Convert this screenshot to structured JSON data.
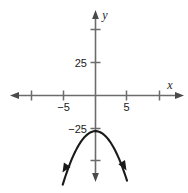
{
  "figure": {
    "width": 188,
    "height": 193,
    "background_color": "#ffffff",
    "axis_color": "#6b6b6b",
    "curve_color": "#1a1a1a",
    "text_color": "#1a1a1a"
  },
  "axes": {
    "x_axis_label": "x",
    "y_axis_label": "y",
    "x_tick_labels": [
      "-5",
      "5"
    ],
    "y_tick_labels": [
      "25",
      "-25"
    ],
    "x_tick_label_minus5": "−5",
    "x_tick_label_5": "5",
    "y_tick_label_25": "25",
    "y_tick_label_minus25": "−25"
  },
  "chart_data": {
    "type": "line",
    "title": "",
    "subtitle": "",
    "xlabel": "x",
    "ylabel": "y",
    "grid": false,
    "legend": null,
    "xlim": [
      -13.3,
      14.0
    ],
    "ylim": [
      -65.4,
      65.4
    ],
    "xticks": [
      -10,
      -5,
      5,
      10
    ],
    "xticklabels": [
      "",
      "-5",
      "5",
      ""
    ],
    "yticks": [
      50,
      25,
      -25,
      -50
    ],
    "yticklabels": [
      "",
      "25",
      "-25",
      ""
    ],
    "x_axis_arrows": [
      "left",
      "right"
    ],
    "y_axis_arrows": [
      "up",
      "down"
    ],
    "series": [
      {
        "name": "parabola",
        "shape": "downward-opening parabola",
        "vertex": [
          0,
          -27
        ],
        "leading_coefficient": -1.5,
        "equation": "y = -1.5x^2 - 27",
        "arrow_ends": [
          "left",
          "right"
        ],
        "x": [
          -5.2,
          -4.5,
          -4.0,
          -3.0,
          -2.0,
          -1.0,
          0.0,
          1.0,
          2.0,
          3.0,
          4.0,
          4.5,
          5.0
        ],
        "y": [
          -67.6,
          -57.4,
          -51.0,
          -40.5,
          -33.0,
          -28.5,
          -27.0,
          -28.5,
          -33.0,
          -40.5,
          -51.0,
          -57.4,
          -64.5
        ]
      }
    ]
  }
}
